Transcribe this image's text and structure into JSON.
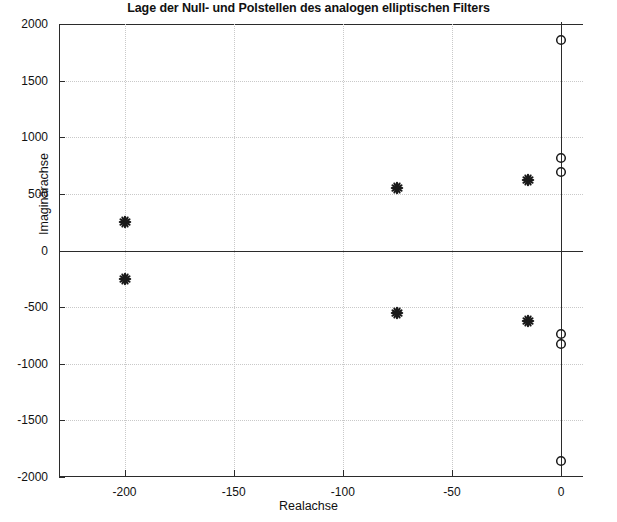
{
  "chart_data": {
    "type": "scatter",
    "title": "Lage der Null- und Polstellen des analogen elliptischen Filters",
    "xlabel": "Realachse",
    "ylabel": "Imaginärachse",
    "xlim": [
      -230,
      10
    ],
    "ylim": [
      -2000,
      2000
    ],
    "xticks": [
      -200,
      -150,
      -100,
      -50,
      0
    ],
    "xtick_labels": [
      "-200",
      "-150",
      "-100",
      "-50",
      "0"
    ],
    "yticks": [
      -2000,
      -1500,
      -1000,
      -500,
      0,
      500,
      1000,
      1500,
      2000
    ],
    "ytick_labels": [
      "-2000",
      "-1500",
      "-1000",
      "-500",
      "0",
      "500",
      "1000",
      "1500",
      "2000"
    ],
    "grid": true,
    "legend": null,
    "series": [
      {
        "name": "Nullstellen",
        "marker": "star",
        "color": "#1a1a1a",
        "points": [
          {
            "x": -200,
            "y": 255
          },
          {
            "x": -200,
            "y": -255
          },
          {
            "x": -75,
            "y": 550
          },
          {
            "x": -75,
            "y": -555
          },
          {
            "x": -15,
            "y": 620
          },
          {
            "x": -15,
            "y": -625
          }
        ]
      },
      {
        "name": "Polstellen",
        "marker": "circle",
        "color": "#1a1a1a",
        "points": [
          {
            "x": 0,
            "y": 1855
          },
          {
            "x": 0,
            "y": 820
          },
          {
            "x": 0,
            "y": 690
          },
          {
            "x": 0,
            "y": -735
          },
          {
            "x": 0,
            "y": -830
          },
          {
            "x": 0,
            "y": -1855
          }
        ]
      }
    ]
  },
  "colors": {
    "axis": "#2b2b2b",
    "grid": "#c9c9c9",
    "marker": "#1a1a1a",
    "background": "#ffffff"
  }
}
